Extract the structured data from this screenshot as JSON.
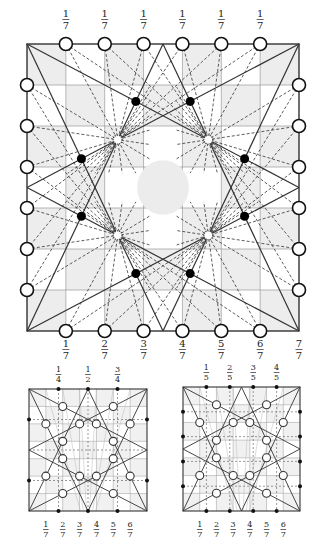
{
  "main_diagram": {
    "box": {
      "x": 27,
      "y": 44,
      "w": 272,
      "h": 287
    },
    "grid_divisions": 7,
    "top_labels": [
      "1/7",
      "1/7",
      "1/7",
      "1/7",
      "1/7",
      "1/7"
    ],
    "bottom_labels": [
      "1/7",
      "2/7",
      "3/7",
      "4/7",
      "5/7",
      "6/7",
      "7/7"
    ],
    "edge_circle_fractions": [
      1,
      2,
      3,
      4,
      5,
      6
    ],
    "black_dots": [
      [
        0.4,
        0.2
      ],
      [
        0.6,
        0.2
      ],
      [
        0.2,
        0.4
      ],
      [
        0.8,
        0.4
      ],
      [
        0.2,
        0.6
      ],
      [
        0.8,
        0.6
      ],
      [
        0.4,
        0.8
      ],
      [
        0.6,
        0.8
      ]
    ],
    "hatched_circles": [
      [
        0.3333,
        0.3333
      ],
      [
        0.6667,
        0.3333
      ],
      [
        0.3333,
        0.6667
      ],
      [
        0.6667,
        0.6667
      ]
    ],
    "center_circle": {
      "cx": 0.5,
      "cy": 0.5,
      "r": 0.095
    },
    "colors": {
      "line": "#333333",
      "shade": "#ededed",
      "grid": "#999999"
    }
  },
  "left_small": {
    "box": {
      "x": 29,
      "y": 389,
      "w": 118,
      "h": 122
    },
    "top_labels": [
      "1/4",
      "1/2",
      "3/4"
    ],
    "top_fracs": [
      0.25,
      0.5,
      0.75
    ],
    "bottom_labels": [
      "1/7",
      "2/7",
      "3/7",
      "4/7",
      "5/7",
      "6/7"
    ],
    "side_dot_fracs": [
      0.25,
      0.75
    ],
    "open_circles": [
      [
        0.286,
        0.143
      ],
      [
        0.714,
        0.143
      ],
      [
        0.143,
        0.286
      ],
      [
        0.429,
        0.286
      ],
      [
        0.571,
        0.286
      ],
      [
        0.857,
        0.286
      ],
      [
        0.286,
        0.429
      ],
      [
        0.714,
        0.429
      ],
      [
        0.286,
        0.571
      ],
      [
        0.714,
        0.571
      ],
      [
        0.143,
        0.714
      ],
      [
        0.429,
        0.714
      ],
      [
        0.571,
        0.714
      ],
      [
        0.857,
        0.714
      ],
      [
        0.286,
        0.857
      ],
      [
        0.714,
        0.857
      ]
    ]
  },
  "right_small": {
    "box": {
      "x": 183,
      "y": 387,
      "w": 117,
      "h": 124
    },
    "top_labels": [
      "1/5",
      "2/5",
      "3/5",
      "4/5"
    ],
    "top_fracs": [
      0.2,
      0.4,
      0.6,
      0.8
    ],
    "bottom_labels": [
      "1/7",
      "2/7",
      "3/7",
      "4/7",
      "5/7",
      "6/7"
    ],
    "side_dot_fracs": [
      0.2,
      0.4,
      0.6,
      0.8
    ],
    "open_circles": [
      [
        0.286,
        0.143
      ],
      [
        0.714,
        0.143
      ],
      [
        0.143,
        0.286
      ],
      [
        0.429,
        0.286
      ],
      [
        0.571,
        0.286
      ],
      [
        0.857,
        0.286
      ],
      [
        0.286,
        0.429
      ],
      [
        0.714,
        0.429
      ],
      [
        0.286,
        0.571
      ],
      [
        0.714,
        0.571
      ],
      [
        0.143,
        0.714
      ],
      [
        0.429,
        0.714
      ],
      [
        0.571,
        0.714
      ],
      [
        0.857,
        0.714
      ],
      [
        0.286,
        0.857
      ],
      [
        0.714,
        0.857
      ]
    ]
  }
}
